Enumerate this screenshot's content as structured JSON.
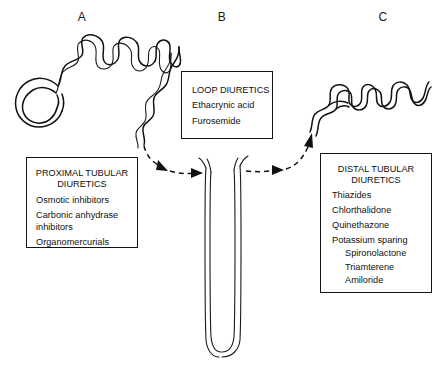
{
  "figure": {
    "type": "medical-diagram",
    "panel_labels": [
      {
        "name": "A",
        "text": "A",
        "region": "proximal-tubule"
      },
      {
        "name": "B",
        "text": "B",
        "region": "loop-of-henle"
      },
      {
        "name": "C",
        "text": "C",
        "region": "distal-tubule"
      }
    ]
  },
  "boxes": {
    "proximal": {
      "title": "PROXIMAL TUBULAR\nDIURETICS",
      "items": [
        "Osmotic inhibitors",
        "Carbonic anhydrase\n   inhibitors",
        "Organomercurials"
      ]
    },
    "loop": {
      "title": "LOOP DIURETICS",
      "items": [
        "Ethacrynic acid",
        "Furosemide"
      ]
    },
    "distal": {
      "title": "DISTAL TUBULAR\nDIURETICS",
      "items": [
        "Thiazides",
        "Chlorthalidone",
        "Quinethazone",
        "Potassium sparing"
      ],
      "subitems": [
        "Spironolactone",
        "Triamterene",
        "Amiloride"
      ]
    }
  },
  "anatomy": {
    "glomerulus_label": "glomerulus-bowmans-capsule",
    "proximal_tubule_label": "proximal-convoluted-tubule",
    "loop_label": "loop-of-henle",
    "distal_tubule_label": "distal-convoluted-tubule"
  },
  "connectors": [
    {
      "name": "proximal-to-loop",
      "style": "dashed-arrow"
    },
    {
      "name": "loop-to-distal",
      "style": "dashed-arrow"
    }
  ],
  "colors": {
    "ink": "#111111",
    "background": "#ffffff"
  }
}
